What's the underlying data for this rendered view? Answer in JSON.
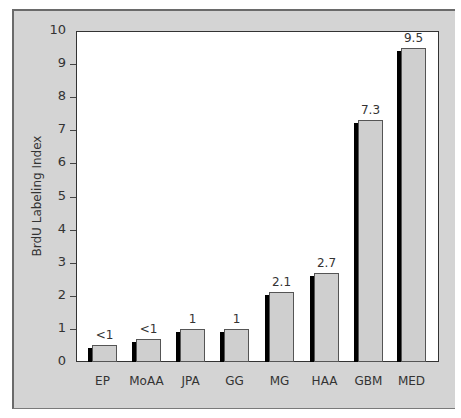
{
  "chart_data": {
    "type": "bar",
    "title": "",
    "xlabel": "",
    "ylabel": "BrdU Labeling Index",
    "ylim": [
      0,
      10
    ],
    "yticks": [
      0,
      1,
      2,
      3,
      4,
      5,
      6,
      7,
      8,
      9,
      10
    ],
    "grid": false,
    "categories": [
      "EP",
      "MoAA",
      "JPA",
      "GG",
      "MG",
      "HAA",
      "GBM",
      "MED"
    ],
    "values": [
      0.5,
      0.7,
      1,
      1,
      2.1,
      2.7,
      7.3,
      9.5
    ],
    "data_labels": [
      "<1",
      "<1",
      "1",
      "1",
      "2.1",
      "2.7",
      "7.3",
      "9.5"
    ],
    "colors": {
      "bar": "#cfcfcf",
      "shadow": "#000000",
      "frame": "#d4d4d4",
      "plot_bg": "#ffffff"
    }
  }
}
